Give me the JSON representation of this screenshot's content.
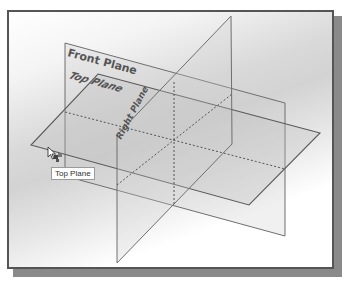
{
  "viewport": {
    "background_top": "#ffffff",
    "background_mid": "#d3d3d3",
    "frame_color": "#555555",
    "shadow_color": "#8a8a8a"
  },
  "planes": {
    "front": {
      "label": "Front Plane",
      "points": "65,43 285,103 285,236 65,176"
    },
    "top": {
      "label": "Top Plane",
      "points": "98,74 320,133 249,205 31,145"
    },
    "right": {
      "label": "Right Plane",
      "points": "117,135 231,16 232,144 117,263"
    }
  },
  "intersections": {
    "vertical": "174,82 174,205",
    "front_top": "65,112 285,169",
    "right_top": "117,135 232,144"
  },
  "tooltip": {
    "text": "Top Plane"
  },
  "cursor": {
    "icon": "select-arrow-with-plane-icon"
  }
}
